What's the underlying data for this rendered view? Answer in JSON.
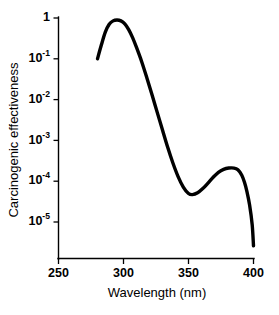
{
  "figure": {
    "background_color": "#ffffff",
    "line_color": "#000000"
  },
  "chart_data": {
    "type": "line",
    "title": "",
    "subtitle": "",
    "xlabel": "Wavelength (nm)",
    "ylabel": "Carcinogenic effectiveness",
    "xlim": [
      250,
      400
    ],
    "ylim": [
      1e-06,
      1
    ],
    "yscale": "log",
    "xscale": "linear",
    "grid": false,
    "legend": null,
    "legend_position": "none",
    "xticks": [
      250,
      300,
      350,
      400
    ],
    "xtick_labels": [
      "250",
      "300",
      "350",
      "400"
    ],
    "yticks": [
      1,
      0.1,
      0.01,
      0.001,
      0.0001,
      1e-05
    ],
    "ytick_labels": [
      "1",
      "10-1",
      "10-2",
      "10-3",
      "10-4",
      "10-5"
    ],
    "ytick_mantissa": [
      "1",
      "10",
      "10",
      "10",
      "10",
      "10"
    ],
    "ytick_exponent": [
      "",
      "-1",
      "-2",
      "-3",
      "-4",
      "-5"
    ],
    "series": [
      {
        "name": "Carcinogenic action spectrum",
        "x": [
          280,
          283,
          286,
          289,
          292,
          295,
          298,
          301,
          304,
          307,
          310,
          314,
          318,
          322,
          326,
          330,
          334,
          338,
          342,
          346,
          350,
          353,
          357,
          361,
          365,
          369,
          373,
          377,
          381,
          385,
          388,
          391,
          393,
          395,
          397,
          399,
          400
        ],
        "y": [
          0.1,
          0.22,
          0.45,
          0.7,
          0.85,
          0.89,
          0.85,
          0.72,
          0.52,
          0.33,
          0.19,
          0.085,
          0.034,
          0.013,
          0.0048,
          0.0018,
          0.00068,
          0.00028,
          0.00013,
          7.2e-05,
          5e-05,
          4.7e-05,
          5.2e-05,
          6.6e-05,
          9e-05,
          0.000125,
          0.000165,
          0.000195,
          0.00021,
          0.00021,
          0.00019,
          0.00014,
          9.5e-05,
          5.5e-05,
          2.6e-05,
          8.5e-06,
          2.6e-06
        ]
      }
    ],
    "annotations": [
      {
        "label": "primary peak",
        "x": 296,
        "y": 0.89
      },
      {
        "label": "local minimum",
        "x": 353,
        "y": 4.7e-05
      },
      {
        "label": "secondary peak",
        "x": 383,
        "y": 0.00021
      }
    ]
  }
}
